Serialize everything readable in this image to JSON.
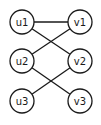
{
  "diagram": {
    "type": "bipartite-graph",
    "left_nodes": [
      {
        "id": "u1",
        "label": "u1",
        "x": 22,
        "y": 22
      },
      {
        "id": "u2",
        "label": "u2",
        "x": 22,
        "y": 61
      },
      {
        "id": "u3",
        "label": "u3",
        "x": 22,
        "y": 101
      }
    ],
    "right_nodes": [
      {
        "id": "v1",
        "label": "v1",
        "x": 80,
        "y": 22
      },
      {
        "id": "v2",
        "label": "v2",
        "x": 80,
        "y": 61
      },
      {
        "id": "v3",
        "label": "v3",
        "x": 80,
        "y": 101
      }
    ],
    "edges": [
      [
        "u1",
        "v1"
      ],
      [
        "u1",
        "v2"
      ],
      [
        "u2",
        "v1"
      ],
      [
        "u2",
        "v3"
      ],
      [
        "u3",
        "v2"
      ]
    ],
    "node_radius": 12,
    "stroke_color": "#1a1a1a"
  }
}
